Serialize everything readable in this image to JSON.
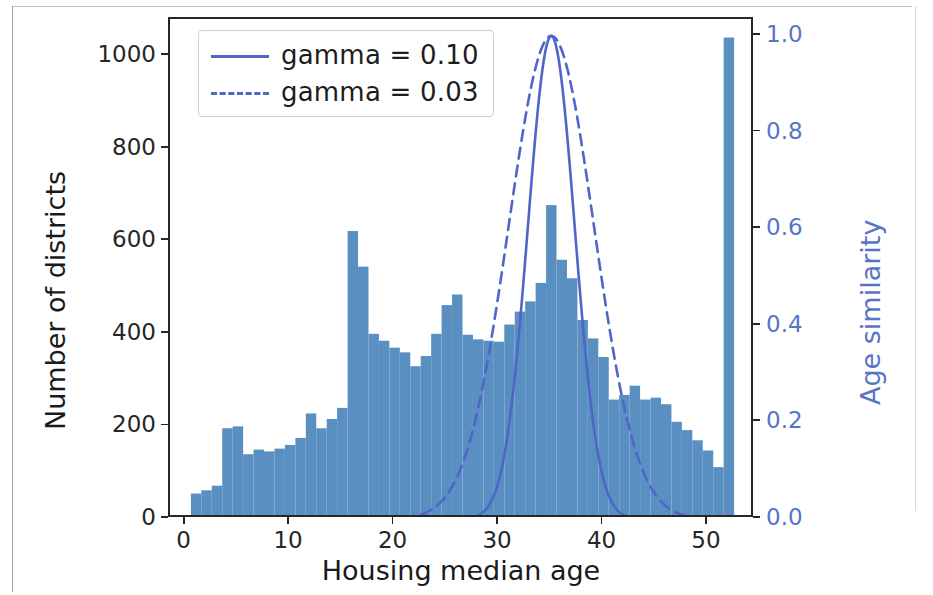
{
  "figure": {
    "background": "#ffffff",
    "bar_color": "#5a8fc2",
    "curve_color": "#4e66c9",
    "right_axis_color": "#5874c8",
    "axis_color": "#262626"
  },
  "legend": {
    "position": "upper left",
    "entries": [
      {
        "label": "gamma = 0.10",
        "style": "solid",
        "color": "#4e66c9",
        "icon": "line-solid-icon"
      },
      {
        "label": "gamma = 0.03",
        "style": "dashed",
        "color": "#4e66c9",
        "icon": "line-dashed-icon"
      }
    ]
  },
  "chart_data": {
    "type": "bar",
    "title": "",
    "subtitle": "",
    "xlabel": "Housing median age",
    "ylabel": "Number of districts",
    "y2label": "Age similarity",
    "grid": false,
    "xlim": [
      -1.5,
      54.5
    ],
    "ylim": [
      0,
      1080
    ],
    "y2lim": [
      0.0,
      1.035
    ],
    "xticks": [
      0,
      10,
      20,
      30,
      40,
      50
    ],
    "xticklabels": [
      "0",
      "10",
      "20",
      "30",
      "40",
      "50"
    ],
    "yticks": [
      0,
      200,
      400,
      600,
      800,
      1000
    ],
    "yticklabels": [
      "0",
      "200",
      "400",
      "600",
      "800",
      "1000"
    ],
    "y2ticks": [
      0.0,
      0.2,
      0.4,
      0.6,
      0.8,
      1.0
    ],
    "y2ticklabels": [
      "0.0",
      "0.2",
      "0.4",
      "0.6",
      "0.8",
      "1.0"
    ],
    "bar_width": 1,
    "histogram": {
      "name": "Number of districts",
      "color": "#5a8fc2",
      "x": [
        1,
        2,
        3,
        4,
        5,
        6,
        7,
        8,
        9,
        10,
        11,
        12,
        13,
        14,
        15,
        16,
        17,
        18,
        19,
        20,
        21,
        22,
        23,
        24,
        25,
        26,
        27,
        28,
        29,
        30,
        31,
        32,
        33,
        34,
        35,
        36,
        37,
        38,
        39,
        40,
        41,
        42,
        43,
        44,
        45,
        46,
        47,
        48,
        49,
        50,
        51,
        52
      ],
      "values": [
        55,
        62,
        72,
        196,
        200,
        140,
        150,
        146,
        152,
        160,
        175,
        228,
        196,
        216,
        240,
        622,
        545,
        400,
        385,
        370,
        360,
        330,
        352,
        400,
        462,
        485,
        398,
        388,
        385,
        383,
        420,
        448,
        470,
        510,
        678,
        560,
        520,
        430,
        390,
        350,
        258,
        268,
        288,
        258,
        262,
        248,
        210,
        192,
        170,
        148,
        112,
        1040
      ]
    },
    "curves": [
      {
        "name": "gamma = 0.10",
        "label": "gamma = 0.10",
        "style": "solid",
        "color": "#4e66c9",
        "axis": "right",
        "form": "rbf",
        "gamma": 0.1,
        "center": 35,
        "peak": 1.0
      },
      {
        "name": "gamma = 0.03",
        "label": "gamma = 0.03",
        "style": "dashed",
        "color": "#4e66c9",
        "axis": "right",
        "form": "rbf",
        "gamma": 0.03,
        "center": 35,
        "peak": 1.0
      }
    ]
  }
}
